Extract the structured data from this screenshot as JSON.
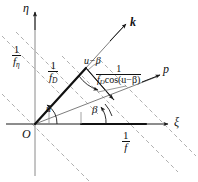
{
  "figure": {
    "type": "geometric-vector-diagram",
    "axes": {
      "x_label": "ξ",
      "y_label": "η",
      "origin_label": "O"
    },
    "vectors": [
      {
        "name": "k-vector",
        "label": "k",
        "style": "bold-italic",
        "angle_deg": 52
      },
      {
        "name": "p-vector",
        "label": "p",
        "style": "italic",
        "angle_deg": 19
      }
    ],
    "angles": [
      {
        "name": "angle-u",
        "label": "u"
      },
      {
        "name": "angle-beta",
        "label": "β"
      },
      {
        "name": "angle-u-minus-beta",
        "label": "u−β"
      }
    ],
    "labels": {
      "inv_f_eta": {
        "num": "1",
        "den": "f",
        "den_sub": "η"
      },
      "inv_f_D": {
        "num": "1",
        "den": "f",
        "den_sub": "D"
      },
      "inv_f": {
        "num": "1",
        "den": "f",
        "den_sub": ""
      },
      "inv_fD_cos": {
        "num": "1",
        "den": "f",
        "den_sub": "D",
        "den_tail": "cos(u−β)"
      }
    },
    "colors": {
      "stroke": "#1a1a1a",
      "dashed": "#9a9a9a",
      "thin": "#6e6e6e"
    }
  }
}
